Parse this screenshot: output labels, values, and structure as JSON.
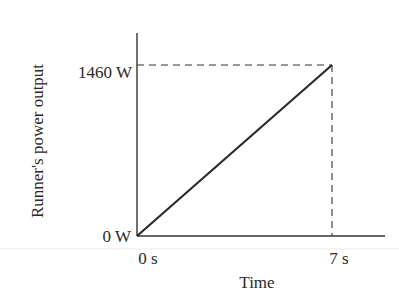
{
  "chart_data": {
    "type": "line",
    "title": "",
    "xlabel": "Time",
    "ylabel": "Runner's power output",
    "x": [
      0,
      7
    ],
    "series": [
      {
        "name": "Runner's power output",
        "values": [
          0,
          1460
        ]
      }
    ],
    "x_ticks": [
      "0 s",
      "7 s"
    ],
    "y_ticks": [
      "0 W",
      "1460 W"
    ],
    "xlim": [
      0,
      8.5
    ],
    "ylim": [
      0,
      1620
    ],
    "grid": false,
    "legend": null,
    "annotations": [
      "dashed guide lines from (7 s, 1460 W) to both axes"
    ]
  },
  "labels": {
    "xlabel": "Time",
    "ylabel": "Runner's power output",
    "x_tick_0": "0 s",
    "x_tick_1": "7 s",
    "y_tick_0": "0 W",
    "y_tick_1": "1460 W"
  },
  "colors": {
    "line": "#2a2a2a",
    "axis": "#333333",
    "text": "#2a2a2a"
  }
}
